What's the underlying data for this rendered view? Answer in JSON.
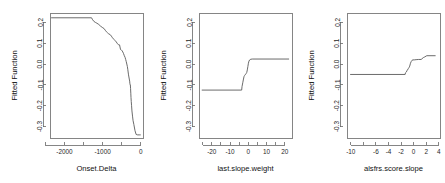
{
  "figure": {
    "type": "multi-panel-line-plot",
    "panel_count": 3,
    "background_color": "#ffffff",
    "line_color": "#5a5a5a",
    "axis_color": "#666666",
    "text_color": "#262626"
  },
  "chart_data": [
    {
      "type": "line",
      "title": "",
      "xlabel": "Onset.Delta",
      "ylabel": "Fitted Function",
      "xlim": [
        -2380,
        60
      ],
      "ylim": [
        -0.355,
        0.245
      ],
      "xticks": [
        -2000,
        -1000,
        0
      ],
      "xtick_labels": [
        "-2000",
        "-1000",
        "0"
      ],
      "xminor_ticks": [
        -2500,
        -1500,
        -500
      ],
      "yticks": [
        0.2,
        0.1,
        0.0,
        -0.1,
        -0.2,
        -0.3
      ],
      "ytick_labels": [
        "0.2",
        "0.1",
        "0.0",
        "-0.1",
        "-0.2",
        "-0.3"
      ],
      "grid": false,
      "legend": "none",
      "x": [
        -2350,
        -1290,
        -1270,
        -1230,
        -1190,
        -1150,
        -1100,
        -1060,
        -1010,
        -960,
        -930,
        -900,
        -870,
        -840,
        -800,
        -770,
        -740,
        -700,
        -670,
        -640,
        -620,
        -600,
        -580,
        -555,
        -530,
        -510,
        -490,
        -470,
        -450,
        -430,
        -410,
        -395,
        -380,
        -365,
        -350,
        -340,
        -330,
        -320,
        -310,
        -300,
        -290,
        -285,
        -278,
        -272,
        -266,
        -260,
        -255,
        -248,
        -240,
        -230,
        -215,
        -200,
        -180,
        -150,
        -120,
        -80,
        -40,
        0
      ],
      "y": [
        0.222,
        0.222,
        0.215,
        0.205,
        0.2,
        0.196,
        0.19,
        0.183,
        0.176,
        0.17,
        0.162,
        0.155,
        0.15,
        0.145,
        0.141,
        0.134,
        0.126,
        0.118,
        0.112,
        0.106,
        0.1,
        0.096,
        0.092,
        0.092,
        0.07,
        0.068,
        0.064,
        0.058,
        0.05,
        0.04,
        0.032,
        0.022,
        0.012,
        0.0,
        -0.012,
        -0.025,
        -0.038,
        -0.052,
        -0.062,
        -0.072,
        -0.082,
        -0.092,
        -0.1,
        -0.1,
        -0.118,
        -0.14,
        -0.16,
        -0.18,
        -0.2,
        -0.225,
        -0.25,
        -0.272,
        -0.29,
        -0.32,
        -0.338,
        -0.34,
        -0.34,
        -0.34
      ]
    },
    {
      "type": "line",
      "title": "",
      "xlabel": "last.slope.weight",
      "ylabel": "Fitted Function",
      "xlim": [
        -27,
        24
      ],
      "ylim": [
        -0.355,
        0.245
      ],
      "xticks": [
        -20,
        -10,
        0,
        10,
        20
      ],
      "xtick_labels": [
        "-20",
        "-10",
        "0",
        "10",
        "20"
      ],
      "xminor_ticks": [
        -25,
        -15,
        -5,
        5,
        15
      ],
      "yticks": [
        0.2,
        0.1,
        0.0,
        -0.1,
        -0.2,
        -0.3
      ],
      "ytick_labels": [
        "0.2",
        "0.1",
        "0.0",
        "-0.1",
        "-0.2",
        "-0.3"
      ],
      "grid": false,
      "legend": "none",
      "x": [
        -25.5,
        -3.6,
        -3.4,
        -3.0,
        -2.6,
        -2.3,
        -2.0,
        -1.7,
        -1.4,
        -1.1,
        -0.8,
        -0.5,
        -0.2,
        0.1,
        0.4,
        0.8,
        1.4,
        2.2,
        22.4
      ],
      "y": [
        -0.125,
        -0.125,
        -0.108,
        -0.09,
        -0.072,
        -0.06,
        -0.055,
        -0.052,
        -0.048,
        -0.045,
        -0.04,
        -0.028,
        -0.012,
        0.004,
        0.014,
        0.02,
        0.023,
        0.024,
        0.024
      ]
    },
    {
      "type": "line",
      "title": "",
      "xlabel": "alsfrs.score.slope",
      "ylabel": "Fitted Function",
      "xlim": [
        -10.6,
        4.2
      ],
      "ylim": [
        -0.355,
        0.245
      ],
      "xticks": [
        -10,
        -8,
        -6,
        -4,
        -2,
        0,
        2,
        4
      ],
      "xtick_labels": [
        "-10",
        "",
        "-6",
        "-4",
        "-2",
        "0",
        "2",
        "4"
      ],
      "xminor_ticks": [],
      "yticks": [
        0.2,
        0.1,
        0.0,
        -0.1,
        -0.2,
        -0.3
      ],
      "ytick_labels": [
        "0.2",
        "0.1",
        "0.0",
        "-0.1",
        "-0.2",
        "-0.3"
      ],
      "grid": false,
      "legend": "none",
      "x": [
        -10.1,
        -1.35,
        -1.3,
        -1.22,
        -1.14,
        -1.05,
        -0.95,
        -0.85,
        -0.75,
        -0.62,
        -0.5,
        -0.38,
        -0.25,
        -0.1,
        0.1,
        0.4,
        0.8,
        1.2,
        1.55,
        1.7,
        2.1,
        3.5
      ],
      "y": [
        -0.05,
        -0.05,
        -0.042,
        -0.04,
        -0.038,
        -0.03,
        -0.028,
        -0.022,
        -0.018,
        -0.01,
        0.004,
        0.012,
        0.018,
        0.02,
        0.02,
        0.021,
        0.022,
        0.022,
        0.031,
        0.033,
        0.04,
        0.04
      ]
    }
  ]
}
